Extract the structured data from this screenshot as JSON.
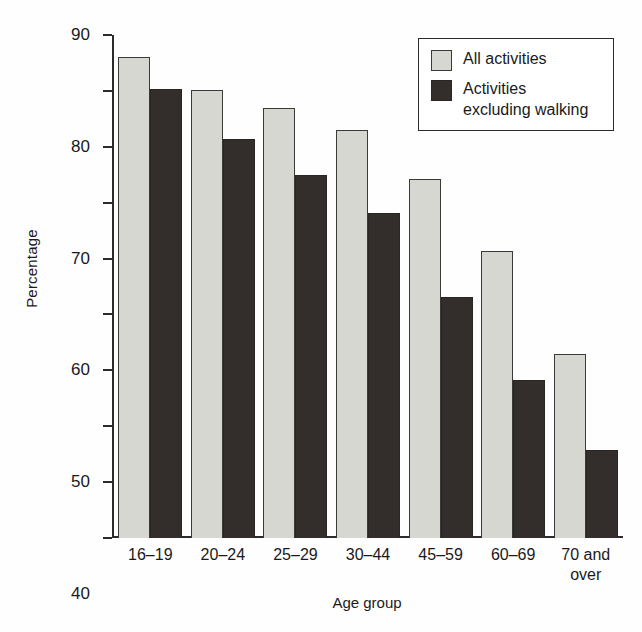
{
  "chart_data": {
    "type": "bar",
    "title": "",
    "xlabel": "Age group",
    "ylabel": "Percentage",
    "categories": [
      "16–19",
      "20–24",
      "25–29",
      "30–44",
      "45–59",
      "60–69",
      "70 and\nover"
    ],
    "series": [
      {
        "name": "All activities",
        "color": "#d7d7d2",
        "values": [
          86.1,
          80.2,
          76.9,
          73.0,
          64.2,
          51.3,
          33.0
        ]
      },
      {
        "name": "Activities\nexcluding walking",
        "color": "#332e2b",
        "values": [
          80.3,
          71.4,
          64.9,
          58.2,
          43.2,
          28.3,
          15.7
        ]
      }
    ],
    "ylim": [
      0,
      90
    ],
    "ytick_step": 10,
    "yticks": [
      "90",
      "80",
      "70",
      "60",
      "50",
      "40",
      "30",
      "20",
      "10",
      "0"
    ],
    "grid": false,
    "legend_position": "top-right",
    "axis_color": "#2b2b2b"
  }
}
